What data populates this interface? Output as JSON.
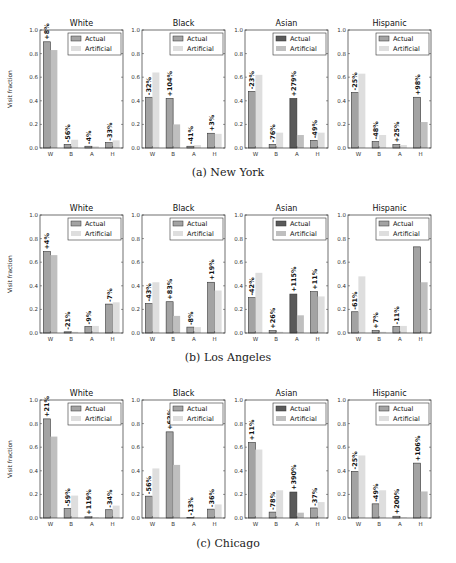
{
  "colors": {
    "actual": "#a3a3a3",
    "actual_highlight": "#5a5a5a",
    "artificial": "#dedede",
    "artificial_highlight": "#bfbfbf",
    "axis": "#333333"
  },
  "legend": {
    "actual": "Actual",
    "artificial": "Artificial"
  },
  "ylabel": "Visit fraction",
  "categories": [
    "W",
    "B",
    "A",
    "H"
  ],
  "yticks": [
    "0.0",
    "0.2",
    "0.4",
    "0.6",
    "0.8",
    "1.0"
  ],
  "captions": [
    "(a) New York",
    "(b) Los Angeles",
    "(c) Chicago"
  ],
  "chart_data": [
    {
      "type": "bar",
      "city": "New York",
      "caption": "(a) New York",
      "ylabel": "Visit fraction",
      "ylim": [
        0,
        1.0
      ],
      "legend_position": "upper right",
      "panels": [
        {
          "title": "White",
          "highlight_index": 0,
          "categories": [
            "W",
            "B",
            "A",
            "H"
          ],
          "series": [
            {
              "name": "Actual",
              "values": [
                0.9,
                0.03,
                0.015,
                0.045
              ]
            },
            {
              "name": "Artificial",
              "values": [
                0.83,
                0.07,
                0.015,
                0.065
              ]
            }
          ],
          "labels": [
            "+8%",
            "-56%",
            "-4%",
            "-33%"
          ]
        },
        {
          "title": "Black",
          "highlight_index": 1,
          "categories": [
            "W",
            "B",
            "A",
            "H"
          ],
          "series": [
            {
              "name": "Actual",
              "values": [
                0.43,
                0.42,
                0.015,
                0.125
              ]
            },
            {
              "name": "Artificial",
              "values": [
                0.64,
                0.2,
                0.025,
                0.12
              ]
            }
          ],
          "labels": [
            "-32%",
            "+104%",
            "-41%",
            "+3%"
          ]
        },
        {
          "title": "Asian",
          "highlight_index": 2,
          "categories": [
            "W",
            "B",
            "A",
            "H"
          ],
          "series": [
            {
              "name": "Actual",
              "values": [
                0.48,
                0.03,
                0.42,
                0.065
              ]
            },
            {
              "name": "Artificial",
              "values": [
                0.62,
                0.13,
                0.11,
                0.13
              ]
            }
          ],
          "labels": [
            "-23%",
            "-76%",
            "+279%",
            "-49%"
          ]
        },
        {
          "title": "Hispanic",
          "highlight_index": 3,
          "categories": [
            "W",
            "B",
            "A",
            "H"
          ],
          "series": [
            {
              "name": "Actual",
              "values": [
                0.47,
                0.055,
                0.03,
                0.43
              ]
            },
            {
              "name": "Artificial",
              "values": [
                0.63,
                0.11,
                0.025,
                0.22
              ]
            }
          ],
          "labels": [
            "-25%",
            "-48%",
            "+25%",
            "+98%"
          ]
        }
      ]
    },
    {
      "type": "bar",
      "city": "Los Angeles",
      "caption": "(b) Los Angeles",
      "ylabel": "Visit fraction",
      "ylim": [
        0,
        1.0
      ],
      "legend_position": "upper right",
      "panels": [
        {
          "title": "White",
          "highlight_index": 0,
          "categories": [
            "W",
            "B",
            "A",
            "H"
          ],
          "series": [
            {
              "name": "Actual",
              "values": [
                0.69,
                0.01,
                0.055,
                0.245
              ]
            },
            {
              "name": "Artificial",
              "values": [
                0.66,
                0.01,
                0.06,
                0.26
              ]
            }
          ],
          "labels": [
            "+4%",
            "-21%",
            "-9%",
            "-7%"
          ]
        },
        {
          "title": "Black",
          "highlight_index": 1,
          "categories": [
            "W",
            "B",
            "A",
            "H"
          ],
          "series": [
            {
              "name": "Actual",
              "values": [
                0.25,
                0.265,
                0.05,
                0.43
              ]
            },
            {
              "name": "Artificial",
              "values": [
                0.43,
                0.145,
                0.05,
                0.36
              ]
            }
          ],
          "labels": [
            "-43%",
            "+83%",
            "-8%",
            "+19%"
          ]
        },
        {
          "title": "Asian",
          "highlight_index": 2,
          "categories": [
            "W",
            "B",
            "A",
            "H"
          ],
          "series": [
            {
              "name": "Actual",
              "values": [
                0.3,
                0.02,
                0.33,
                0.35
              ]
            },
            {
              "name": "Artificial",
              "values": [
                0.51,
                0.01,
                0.15,
                0.31
              ]
            }
          ],
          "labels": [
            "-42%",
            "+26%",
            "+115%",
            "+11%"
          ]
        },
        {
          "title": "Hispanic",
          "highlight_index": 3,
          "categories": [
            "W",
            "B",
            "A",
            "H"
          ],
          "series": [
            {
              "name": "Actual",
              "values": [
                0.18,
                0.02,
                0.055,
                0.73
              ]
            },
            {
              "name": "Artificial",
              "values": [
                0.48,
                0.01,
                0.06,
                0.43
              ]
            }
          ],
          "labels": [
            "-61%",
            "+7%",
            "-11%",
            ""
          ]
        }
      ]
    },
    {
      "type": "bar",
      "city": "Chicago",
      "caption": "(c) Chicago",
      "ylabel": "Visit fraction",
      "ylim": [
        0,
        1.0
      ],
      "legend_position": "upper right",
      "panels": [
        {
          "title": "White",
          "highlight_index": 0,
          "categories": [
            "W",
            "B",
            "A",
            "H"
          ],
          "series": [
            {
              "name": "Actual",
              "values": [
                0.84,
                0.08,
                0.01,
                0.07
              ]
            },
            {
              "name": "Artificial",
              "values": [
                0.69,
                0.19,
                0.005,
                0.105
              ]
            }
          ],
          "labels": [
            "+21%",
            "-59%",
            "+119%",
            "-34%"
          ]
        },
        {
          "title": "Black",
          "highlight_index": 1,
          "categories": [
            "W",
            "B",
            "A",
            "H"
          ],
          "series": [
            {
              "name": "Actual",
              "values": [
                0.185,
                0.73,
                0.004,
                0.075
              ]
            },
            {
              "name": "Artificial",
              "values": [
                0.42,
                0.45,
                0.005,
                0.115
              ]
            }
          ],
          "labels": [
            "-56%",
            "+62%",
            "-13%",
            "-36%"
          ]
        },
        {
          "title": "Asian",
          "highlight_index": 2,
          "categories": [
            "W",
            "B",
            "A",
            "H"
          ],
          "series": [
            {
              "name": "Actual",
              "values": [
                0.64,
                0.05,
                0.22,
                0.085
              ]
            },
            {
              "name": "Artificial",
              "values": [
                0.58,
                0.235,
                0.045,
                0.135
              ]
            }
          ],
          "labels": [
            "+11%",
            "-78%",
            "+390%",
            "-37%"
          ]
        },
        {
          "title": "Hispanic",
          "highlight_index": 3,
          "categories": [
            "W",
            "B",
            "A",
            "H"
          ],
          "series": [
            {
              "name": "Actual",
              "values": [
                0.395,
                0.12,
                0.015,
                0.465
              ]
            },
            {
              "name": "Artificial",
              "values": [
                0.53,
                0.235,
                0.005,
                0.225
              ]
            }
          ],
          "labels": [
            "-25%",
            "-49%",
            "+200%",
            "+106%"
          ]
        }
      ]
    }
  ]
}
